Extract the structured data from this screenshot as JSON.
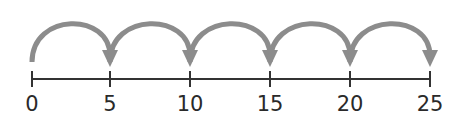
{
  "diagram": {
    "type": "number-line-skip-counting",
    "start": 0,
    "end": 25,
    "step": 5,
    "ticks": [
      {
        "value": 0,
        "label": "0",
        "x": 32
      },
      {
        "value": 5,
        "label": "5",
        "x": 110
      },
      {
        "value": 10,
        "label": "10",
        "x": 190
      },
      {
        "value": 15,
        "label": "15",
        "x": 270
      },
      {
        "value": 20,
        "label": "20",
        "x": 350
      },
      {
        "value": 25,
        "label": "25",
        "x": 430
      }
    ],
    "jumps": [
      {
        "from": 0,
        "to": 5
      },
      {
        "from": 5,
        "to": 10
      },
      {
        "from": 10,
        "to": 15
      },
      {
        "from": 15,
        "to": 20
      },
      {
        "from": 20,
        "to": 25
      }
    ],
    "colors": {
      "line": "#333333",
      "arc": "#8c8c8c",
      "label": "#2a2a2a"
    }
  }
}
